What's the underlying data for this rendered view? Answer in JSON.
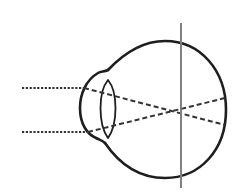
{
  "diagram": {
    "type": "eye-optics",
    "colors": {
      "outline": "#1e1e1e",
      "rays": "#333333",
      "image_plane": "#808080",
      "background": "#ffffff"
    },
    "elements": {
      "eyeball": "eyeball-outline",
      "cornea": "cornea-bulge",
      "lens": "lens-ellipse",
      "incoming_rays": [
        "ray-top-dotted",
        "ray-bottom-dotted"
      ],
      "refracted_rays": [
        "ray-top-dashed",
        "ray-bottom-dashed"
      ],
      "image_plane": "vertical-plane-line"
    }
  }
}
